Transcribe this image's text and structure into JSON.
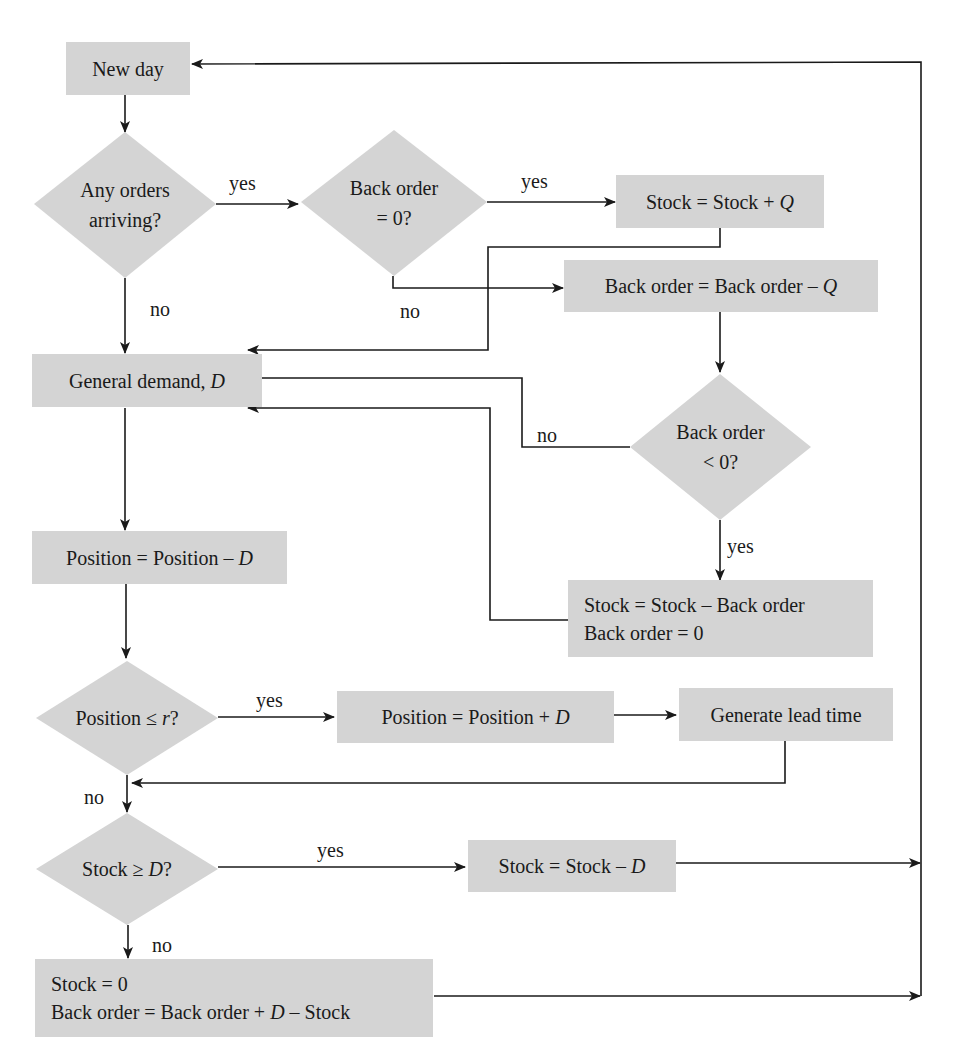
{
  "diagram": {
    "colors": {
      "node_fill": "#d4d4d4",
      "line": "#1a1a1a",
      "background": "#ffffff"
    },
    "nodes": {
      "new_day": "New day",
      "any_orders": {
        "line1": "Any orders",
        "line2": "arriving?"
      },
      "back_order_zero": {
        "line1": "Back order",
        "line2": "= 0?"
      },
      "stock_plus_q": {
        "prefix": "Stock = Stock + ",
        "var": "Q"
      },
      "back_order_minus_q": {
        "prefix": "Back order = Back order – ",
        "var": "Q"
      },
      "general_demand": {
        "prefix": "General demand, ",
        "var": "D"
      },
      "back_order_neg": {
        "line1": "Back order",
        "line2": "< 0?"
      },
      "stock_minus_back_order": {
        "line1": "Stock = Stock – Back order",
        "line2": "Back order = 0"
      },
      "position_minus_d": {
        "prefix": "Position = Position – ",
        "var": "D"
      },
      "position_le_r": {
        "prefix": "Position ≤ ",
        "var": "r",
        "suffix": "?"
      },
      "position_plus_d": {
        "prefix": "Position = Position + ",
        "var": "D"
      },
      "generate_lead_time": "Generate lead time",
      "stock_ge_d": {
        "prefix": "Stock ≥ ",
        "var": "D",
        "suffix": "?"
      },
      "stock_minus_d": {
        "prefix": "Stock = Stock – ",
        "var": "D"
      },
      "stock_zero": {
        "line1": "Stock = 0",
        "line2_prefix": "Back order = Back order + ",
        "line2_var": "D",
        "line2_suffix": " – Stock"
      }
    },
    "edge_labels": {
      "any_orders_yes": "yes",
      "any_orders_no": "no",
      "back_order_zero_yes": "yes",
      "back_order_zero_no": "no",
      "back_order_neg_no": "no",
      "back_order_neg_yes": "yes",
      "position_le_r_yes": "yes",
      "position_le_r_no": "no",
      "stock_ge_d_yes": "yes",
      "stock_ge_d_no": "no"
    }
  }
}
